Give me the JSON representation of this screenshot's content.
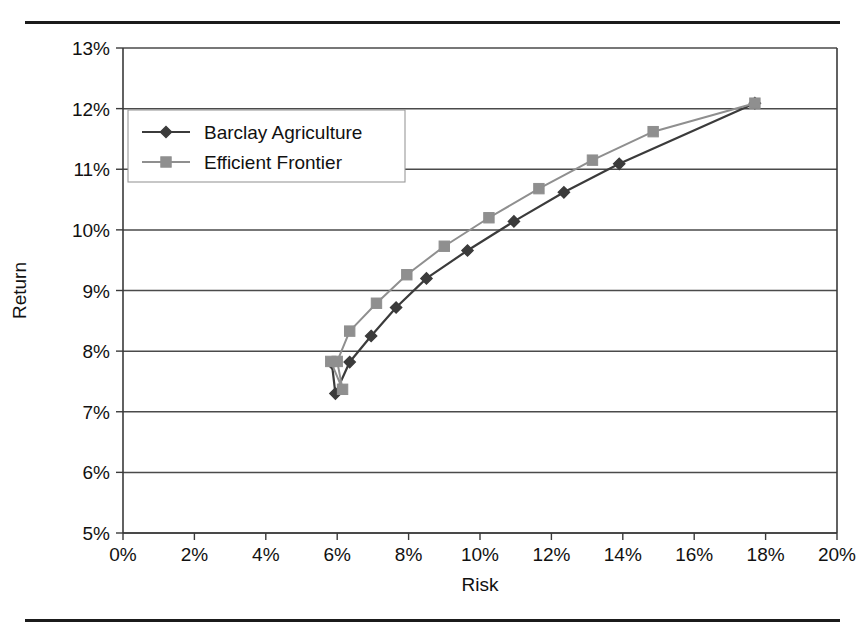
{
  "page": {
    "clipped_header_text": "",
    "top_rule": true,
    "bottom_rule": true
  },
  "chart_data": {
    "type": "line",
    "title": "",
    "xlabel": "Risk",
    "ylabel": "Return",
    "xlim": [
      0,
      20
    ],
    "ylim": [
      5,
      13
    ],
    "xticks": [
      "0%",
      "2%",
      "4%",
      "6%",
      "8%",
      "10%",
      "12%",
      "14%",
      "16%",
      "18%",
      "20%"
    ],
    "xtick_values": [
      0,
      2,
      4,
      6,
      8,
      10,
      12,
      14,
      16,
      18,
      20
    ],
    "yticks": [
      "5%",
      "6%",
      "7%",
      "8%",
      "9%",
      "10%",
      "11%",
      "12%",
      "13%"
    ],
    "ytick_values": [
      5,
      6,
      7,
      8,
      9,
      10,
      11,
      12,
      13
    ],
    "grid": "horizontal",
    "legend_position": "upper left",
    "units": "percent",
    "series": [
      {
        "name": "Barclay Agriculture",
        "marker": "diamond",
        "color": "#3b3b3b",
        "points": [
          {
            "x": 5.85,
            "y": 7.8
          },
          {
            "x": 5.95,
            "y": 7.3
          },
          {
            "x": 6.35,
            "y": 7.82
          },
          {
            "x": 6.95,
            "y": 8.25
          },
          {
            "x": 7.65,
            "y": 8.72
          },
          {
            "x": 8.5,
            "y": 9.2
          },
          {
            "x": 9.65,
            "y": 9.66
          },
          {
            "x": 10.95,
            "y": 10.14
          },
          {
            "x": 12.35,
            "y": 10.62
          },
          {
            "x": 13.9,
            "y": 11.09
          },
          {
            "x": 17.7,
            "y": 12.09
          }
        ]
      },
      {
        "name": "Efficient Frontier",
        "marker": "square",
        "color": "#8f8f8f",
        "points": [
          {
            "x": 5.82,
            "y": 7.83
          },
          {
            "x": 6.15,
            "y": 7.37
          },
          {
            "x": 6.0,
            "y": 7.83
          },
          {
            "x": 6.35,
            "y": 8.33
          },
          {
            "x": 7.1,
            "y": 8.79
          },
          {
            "x": 7.95,
            "y": 9.26
          },
          {
            "x": 9.0,
            "y": 9.73
          },
          {
            "x": 10.25,
            "y": 10.2
          },
          {
            "x": 11.65,
            "y": 10.68
          },
          {
            "x": 13.15,
            "y": 11.15
          },
          {
            "x": 14.85,
            "y": 11.62
          },
          {
            "x": 17.7,
            "y": 12.09
          }
        ]
      }
    ]
  }
}
